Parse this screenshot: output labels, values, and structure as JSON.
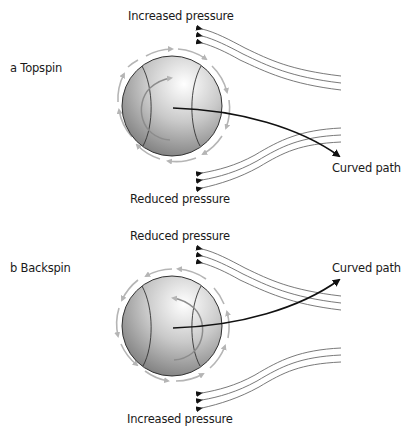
{
  "panels": [
    {
      "id": "topspin",
      "title": "a Topspin",
      "top_label": "Increased pressure",
      "bottom_label": "Reduced pressure",
      "path_label": "Curved path",
      "spin": "topspin",
      "path_direction": "down"
    },
    {
      "id": "backspin",
      "title": "b Backspin",
      "top_label": "Reduced pressure",
      "bottom_label": "Increased pressure",
      "path_label": "Curved path",
      "spin": "backspin",
      "path_direction": "up"
    }
  ],
  "colors": {
    "ball_light": "#f4f4f4",
    "ball_dark": "#7a7a7a",
    "spin_arrows": "#b5b5b5",
    "airflow_lines": "#6a6a6a",
    "path": "#111111"
  }
}
